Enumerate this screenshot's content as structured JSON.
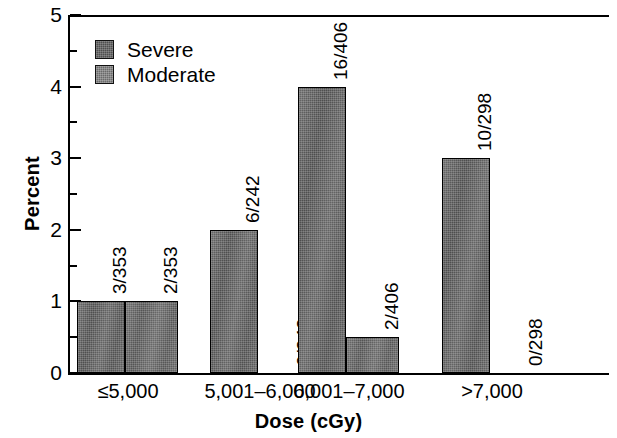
{
  "chart_data": {
    "type": "bar",
    "title": "",
    "xlabel": "Dose (cGy)",
    "ylabel": "Percent",
    "categories": [
      "≤5,000",
      "5,001–6,000",
      "6,001–7,000",
      ">7,000"
    ],
    "ylim": [
      0,
      5
    ],
    "yticks": [
      0,
      1,
      2,
      3,
      4,
      5
    ],
    "ytick_labels": [
      "0",
      "1",
      "2",
      "3",
      "4",
      "5"
    ],
    "yminor_ticks": [
      0.5,
      1.5,
      2.5,
      3.5,
      4.5
    ],
    "grid": false,
    "legend_position": "upper left",
    "series": [
      {
        "name": "Severe",
        "color": "#585858",
        "values": [
          1.0,
          2.0,
          4.0,
          3.0
        ],
        "labels": [
          "3/353",
          "6/242",
          "16/406",
          "10/298"
        ]
      },
      {
        "name": "Moderate",
        "color": "#5e5e5e",
        "values": [
          1.0,
          0.0,
          0.5,
          0.0
        ],
        "labels": [
          "2/353",
          "0/242",
          "2/406",
          "0/298"
        ]
      }
    ]
  },
  "legend": {
    "items": [
      {
        "label": "Severe",
        "swatch": "severe"
      },
      {
        "label": "Moderate",
        "swatch": "moderate"
      }
    ]
  }
}
